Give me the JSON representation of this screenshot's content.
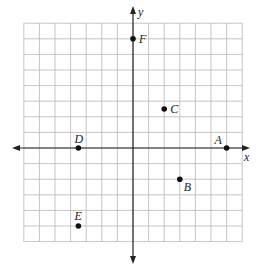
{
  "chart_data": {
    "type": "scatter",
    "title": "",
    "xlabel": "x",
    "ylabel": "y",
    "xlim": [
      -7,
      7
    ],
    "ylim": [
      -6,
      8
    ],
    "grid": true,
    "tick_labels": false,
    "points": [
      {
        "label": "A",
        "x": 6,
        "y": 0
      },
      {
        "label": "B",
        "x": 3,
        "y": -2
      },
      {
        "label": "C",
        "x": 2,
        "y": 2.5
      },
      {
        "label": "D",
        "x": -3.5,
        "y": 0
      },
      {
        "label": "E",
        "x": -3.5,
        "y": -5
      },
      {
        "label": "F",
        "x": 0,
        "y": 7
      }
    ]
  },
  "axes": {
    "x_label": "x",
    "y_label": "y"
  },
  "colors": {
    "grid": "#b8b8b8",
    "axis": "#222222",
    "point": "#111111"
  }
}
